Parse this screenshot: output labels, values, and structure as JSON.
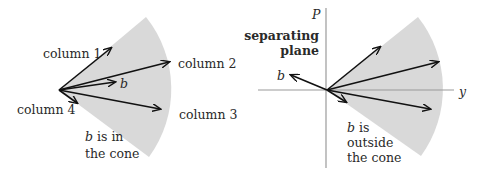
{
  "left_panel": {
    "labels": {
      "column1": "column 1",
      "column2": "column 2",
      "column3": "column 3",
      "column4": "column 4",
      "b": "b",
      "caption_b": "b",
      "caption_line1": " is in",
      "caption_line2": "the cone"
    }
  },
  "right_panel": {
    "labels": {
      "axis_p": "P",
      "axis_y": "y",
      "plane_line1": "separating",
      "plane_line2": "plane",
      "b": "b",
      "caption_b": "b",
      "caption_line1": " is",
      "caption_line2": "outside",
      "caption_line3": "the cone"
    }
  },
  "colors": {
    "cone_fill": "#d9d9d9",
    "arrow": "#111111",
    "axis": "#9a9a9a",
    "text": "#2a2a2a"
  }
}
